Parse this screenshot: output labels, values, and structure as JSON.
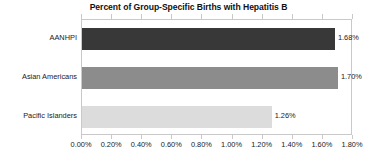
{
  "chart_data": {
    "type": "bar",
    "orientation": "horizontal",
    "title": "Percent of Group-Specific Births with Hepatitis B",
    "xlabel": "",
    "ylabel": "",
    "categories": [
      "AANHPI",
      "Asian Americans",
      "Pacific Islanders"
    ],
    "values": [
      1.68,
      1.7,
      1.26
    ],
    "value_labels": [
      "1.68%",
      "1.70%",
      "1.26%"
    ],
    "bar_colors": [
      "#383838",
      "#8c8c8c",
      "#dcdcdc"
    ],
    "xlim": [
      0,
      1.8
    ],
    "xtick_values": [
      0,
      0.2,
      0.4,
      0.6,
      0.8,
      1.0,
      1.2,
      1.4,
      1.6,
      1.8
    ],
    "xtick_labels": [
      "0.00%",
      "0.20%",
      "0.40%",
      "0.60%",
      "0.80%",
      "1.00%",
      "1.20%",
      "1.40%",
      "1.60%",
      "1.80%"
    ],
    "grid": false,
    "legend": "none",
    "plot_border_color": "#c9c9c9",
    "text_color": "#222222"
  }
}
